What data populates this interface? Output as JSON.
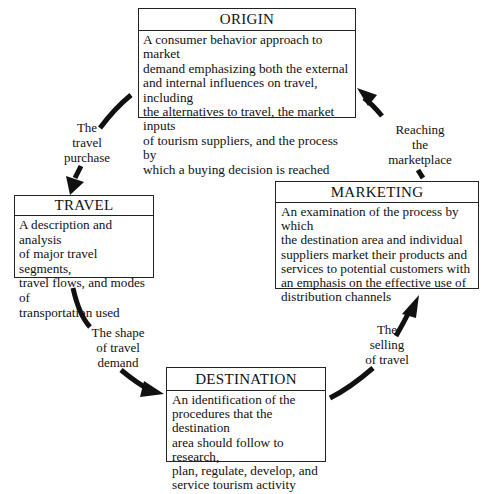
{
  "diagram": {
    "type": "cycle",
    "stages": [
      {
        "id": "origin",
        "title": "ORIGIN",
        "description": "A consumer behavior approach to market\ndemand emphasizing both the external\nand internal influences on travel, including\nthe alternatives to travel, the market inputs\nof tourism suppliers, and the process by\nwhich a buying decision is reached"
      },
      {
        "id": "travel",
        "title": "TRAVEL",
        "description": "A description and analysis\nof major travel segments,\ntravel flows, and modes of\ntransportation used"
      },
      {
        "id": "destination",
        "title": "DESTINATION",
        "description": "An identification of the\nprocedures that the destination\narea should follow to research,\nplan, regulate, develop, and\nservice tourism activity"
      },
      {
        "id": "marketing",
        "title": "MARKETING",
        "description": "An examination of the process by which\nthe destination area and individual\nsuppliers market their products and\nservices to potential customers with\nan emphasis on the effective use of\ndistribution channels"
      }
    ],
    "links": [
      {
        "from": "origin",
        "to": "travel",
        "label": "The\ntravel\npurchase"
      },
      {
        "from": "travel",
        "to": "destination",
        "label": "The shape\nof travel\ndemand"
      },
      {
        "from": "destination",
        "to": "marketing",
        "label": "The\nselling\nof travel"
      },
      {
        "from": "marketing",
        "to": "origin",
        "label": "Reaching\nthe\nmarketplace"
      }
    ]
  },
  "colors": {
    "stroke": "#111111",
    "background": "#ffffff"
  }
}
